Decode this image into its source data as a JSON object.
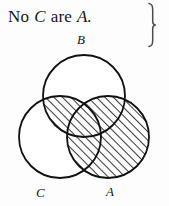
{
  "figure": {
    "type": "venn-diagram",
    "background_color": "#fdfdfd",
    "ink_color": "#111111"
  },
  "proposition": {
    "full_text": "No C are A.",
    "tokens": [
      {
        "text": "No",
        "style": "roman"
      },
      {
        "text": "C",
        "style": "italic"
      },
      {
        "text": "are",
        "style": "roman"
      },
      {
        "text": "A.",
        "style": "italic"
      }
    ],
    "subject_term": "C",
    "predicate_term": "A",
    "quantifier": "No",
    "copula": "are",
    "period": "."
  },
  "brace": {
    "glyph": "}",
    "orientation": "right",
    "label": "grouping-brace"
  },
  "venn": {
    "circles": [
      {
        "id": "B",
        "label": "B",
        "cx": 84,
        "cy": 96,
        "r": 41,
        "shaded": false,
        "label_x": 81,
        "label_y": 38
      },
      {
        "id": "C",
        "label": "C",
        "cx": 60,
        "cy": 137,
        "r": 41,
        "shaded": false,
        "label_x": 39,
        "label_y": 192
      },
      {
        "id": "A",
        "label": "A",
        "cx": 108,
        "cy": 137,
        "r": 41,
        "shaded": true,
        "label_x": 109,
        "label_y": 192
      }
    ],
    "shaded_regions": [
      {
        "id": "A-whole",
        "description": "entire A circle",
        "hatched": true
      },
      {
        "id": "B-and-C-only",
        "description": "B intersect C outside A",
        "hatched": true
      }
    ],
    "unshaded_regions": [
      {
        "id": "B-only",
        "description": "B alone"
      },
      {
        "id": "C-only",
        "description": "C alone"
      }
    ],
    "hatch": {
      "style": "diagonal-lines",
      "direction": "lower-left-to-upper-right",
      "angle_deg": 45,
      "spacing_px": 6,
      "line_width_px": 1.6,
      "color": "#141414"
    },
    "stroke_width_px": 1.8
  }
}
